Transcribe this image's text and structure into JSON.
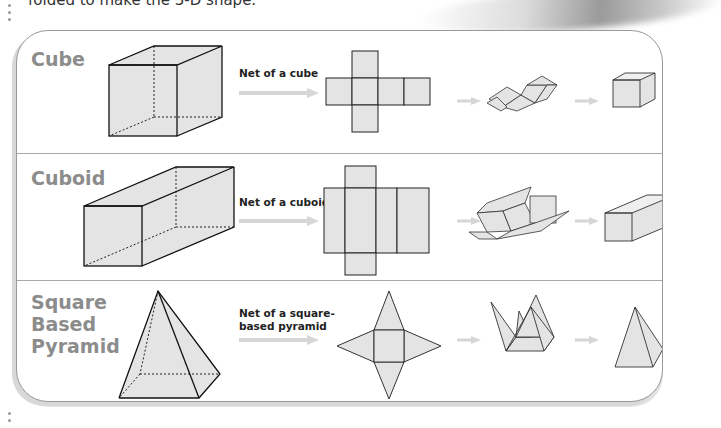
{
  "intro_text": "folded to make the 3-D shape.",
  "colors": {
    "face_fill": "#e4e4e4",
    "edge": "#1a1a1a",
    "label_gray": "#8c8c8c",
    "arrow_gray": "#d4d4d4",
    "panel_border": "#999999"
  },
  "rows": [
    {
      "shape_name": "Cube",
      "net_label_line1": "Net of a cube",
      "net_label_line2": "",
      "steps": [
        "3-D shape",
        "net",
        "partially folded net",
        "folded shape"
      ]
    },
    {
      "shape_name": "Cuboid",
      "net_label_line1": "Net of a cuboid",
      "net_label_line2": "",
      "steps": [
        "3-D shape",
        "net",
        "partially folded net",
        "folded shape"
      ]
    },
    {
      "shape_name_lines": [
        "Square",
        "Based",
        "Pyramid"
      ],
      "net_label_line1": "Net of a square-",
      "net_label_line2": "based pyramid",
      "steps": [
        "3-D shape",
        "net",
        "partially folded net",
        "folded shape"
      ]
    }
  ]
}
